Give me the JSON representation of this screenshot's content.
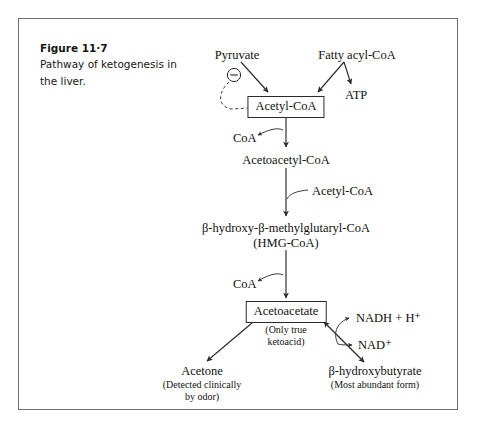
{
  "figure": {
    "number": "Figure 11·7",
    "description": "Pathway of ketogenesis in the liver."
  },
  "diagram": {
    "type": "metabolic-pathway",
    "title": "Pathway of ketogenesis in the liver",
    "nodes": {
      "pyruvate": "Pyruvate",
      "fatty_acyl_coa": "Fatty acyl-CoA",
      "atp": "ATP",
      "acetyl_coa_boxed": "Acetyl-CoA",
      "coa_1": "CoA",
      "acetoacetyl_coa": "Acetoacetyl-CoA",
      "acetyl_coa_input": "Acetyl-CoA",
      "hmg_coa_line1": "β-hydroxy-β-methylglutaryl-CoA",
      "hmg_coa_line2": "(HMG-CoA)",
      "coa_2": "CoA",
      "acetoacetate_boxed": "Acetoacetate",
      "acetoacetate_note_line1": "(Only true",
      "acetoacetate_note_line2": "ketoacid)",
      "nadh": "NADH + H⁺",
      "nad": "NAD⁺",
      "acetone": "Acetone",
      "acetone_note_line1": "(Detected clinically",
      "acetone_note_line2": "by odor)",
      "beta_hydroxybutyrate": "β-hydroxybutyrate",
      "beta_hydroxybutyrate_note": "(Most abundant form)"
    },
    "inhibition_symbol": "−",
    "edges": [
      {
        "from": "pyruvate",
        "to": "acetyl_coa_boxed",
        "style": "solid-arrow"
      },
      {
        "from": "pyruvate",
        "to": "acetyl_coa_boxed",
        "style": "dashed-inhibition",
        "marker": "circled-minus"
      },
      {
        "from": "fatty_acyl_coa",
        "to": "acetyl_coa_boxed",
        "style": "solid-arrow"
      },
      {
        "from": "fatty_acyl_coa",
        "to": "atp",
        "style": "solid-arrow"
      },
      {
        "from": "acetyl_coa_boxed",
        "to": "acetoacetyl_coa",
        "style": "solid-arrow",
        "releases": "coa_1"
      },
      {
        "from": "acetoacetyl_coa",
        "to": "hmg_coa_line1",
        "style": "solid-arrow",
        "consumes": "acetyl_coa_input"
      },
      {
        "from": "hmg_coa_line1",
        "to": "acetoacetate_boxed",
        "style": "solid-arrow",
        "releases": "coa_2"
      },
      {
        "from": "acetoacetate_boxed",
        "to": "acetone",
        "style": "solid-arrow"
      },
      {
        "from": "acetoacetate_boxed",
        "to": "beta_hydroxybutyrate",
        "style": "double-arrow",
        "cofactors": [
          "nadh",
          "nad"
        ]
      }
    ],
    "colors": {
      "frame": "#6e6e72",
      "text": "#111111",
      "arrow": "#2b2b2b",
      "background": "#ffffff"
    }
  }
}
